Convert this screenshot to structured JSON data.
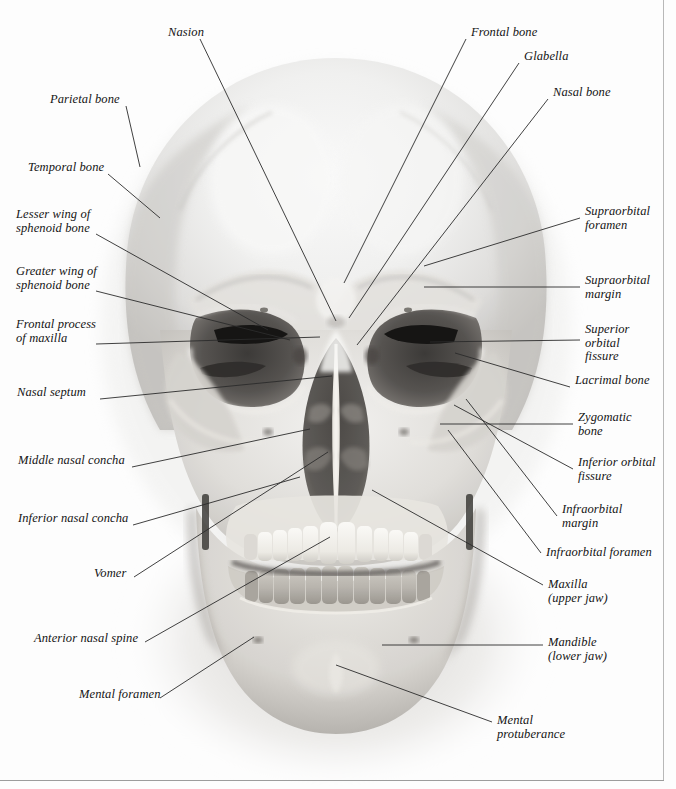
{
  "figure": {
    "kind": "anatomical-illustration",
    "style": "black-and-white photograph with leader-line labels",
    "background_color": "#ffffff",
    "border_color": "#b8b8b8",
    "label_color": "#141414",
    "leader_color": "#2b2b2b",
    "width": 676,
    "height": 789
  },
  "labels": [
    {
      "id": "nasion",
      "text": "Nasion",
      "side": "left",
      "x": 168,
      "y": 26,
      "anchor_x": 200,
      "anchor_y": 39,
      "target_x": 336,
      "target_y": 321
    },
    {
      "id": "frontal-bone",
      "text": "Frontal bone",
      "side": "right",
      "x": 471,
      "y": 26,
      "anchor_x": 466,
      "anchor_y": 39,
      "target_x": 344,
      "target_y": 283
    },
    {
      "id": "glabella",
      "text": "Glabella",
      "side": "right",
      "x": 524,
      "y": 50,
      "anchor_x": 519,
      "anchor_y": 63,
      "target_x": 349,
      "target_y": 318
    },
    {
      "id": "parietal-bone",
      "text": "Parietal bone",
      "side": "left",
      "x": 50,
      "y": 93,
      "anchor_x": 126,
      "anchor_y": 106,
      "target_x": 140,
      "target_y": 167
    },
    {
      "id": "nasal-bone",
      "text": "Nasal bone",
      "side": "right",
      "x": 553,
      "y": 86,
      "anchor_x": 548,
      "anchor_y": 99,
      "target_x": 357,
      "target_y": 345
    },
    {
      "id": "temporal-bone",
      "text": "Temporal bone",
      "side": "left",
      "x": 28,
      "y": 161,
      "anchor_x": 108,
      "anchor_y": 174,
      "target_x": 160,
      "target_y": 218
    },
    {
      "id": "supraorbital-foramen",
      "text": "Supraorbital\nforamen",
      "side": "right",
      "x": 585,
      "y": 205,
      "anchor_x": 580,
      "anchor_y": 218,
      "target_x": 424,
      "target_y": 266
    },
    {
      "id": "lesser-wing-sphenoid",
      "text": "Lesser wing of\nsphenoid bone",
      "side": "left",
      "x": 16,
      "y": 208,
      "anchor_x": 96,
      "anchor_y": 234,
      "target_x": 268,
      "target_y": 330
    },
    {
      "id": "supraorbital-margin",
      "text": "Supraorbital\nmargin",
      "side": "right",
      "x": 585,
      "y": 274,
      "anchor_x": 580,
      "anchor_y": 287,
      "target_x": 424,
      "target_y": 287
    },
    {
      "id": "greater-wing-sphenoid",
      "text": "Greater wing of\nsphenoid bone",
      "side": "left",
      "x": 16,
      "y": 265,
      "anchor_x": 96,
      "anchor_y": 291,
      "target_x": 290,
      "target_y": 340
    },
    {
      "id": "frontal-process-maxilla",
      "text": "Frontal process\nof maxilla",
      "side": "left",
      "x": 16,
      "y": 318,
      "anchor_x": 96,
      "anchor_y": 344,
      "target_x": 320,
      "target_y": 337
    },
    {
      "id": "superior-orbital-fissure",
      "text": "Superior\norbital\nfissure",
      "side": "right",
      "x": 585,
      "y": 323,
      "anchor_x": 580,
      "anchor_y": 340,
      "target_x": 430,
      "target_y": 342
    },
    {
      "id": "lacrimal-bone",
      "text": "Lacrimal bone",
      "side": "right",
      "x": 575,
      "y": 374,
      "anchor_x": 570,
      "anchor_y": 387,
      "target_x": 455,
      "target_y": 353
    },
    {
      "id": "nasal-septum",
      "text": "Nasal septum",
      "side": "left",
      "x": 17,
      "y": 386,
      "anchor_x": 100,
      "anchor_y": 399,
      "target_x": 332,
      "target_y": 376
    },
    {
      "id": "zygomatic-bone",
      "text": "Zygomatic\nbone",
      "side": "right",
      "x": 578,
      "y": 411,
      "anchor_x": 573,
      "anchor_y": 424,
      "target_x": 440,
      "target_y": 424
    },
    {
      "id": "middle-nasal-concha",
      "text": "Middle nasal concha",
      "side": "left",
      "x": 18,
      "y": 454,
      "anchor_x": 132,
      "anchor_y": 467,
      "target_x": 310,
      "target_y": 429
    },
    {
      "id": "inferior-orbital-fissure",
      "text": "Inferior orbital\nfissure",
      "side": "right",
      "x": 578,
      "y": 456,
      "anchor_x": 573,
      "anchor_y": 469,
      "target_x": 454,
      "target_y": 405
    },
    {
      "id": "infraorbital-margin",
      "text": "Infraorbital\nmargin",
      "side": "right",
      "x": 562,
      "y": 503,
      "anchor_x": 557,
      "anchor_y": 516,
      "target_x": 466,
      "target_y": 399
    },
    {
      "id": "inferior-nasal-concha",
      "text": "Inferior nasal concha",
      "side": "left",
      "x": 18,
      "y": 512,
      "anchor_x": 133,
      "anchor_y": 525,
      "target_x": 300,
      "target_y": 477
    },
    {
      "id": "infraorbital-foramen",
      "text": "Infraorbital foramen",
      "side": "right",
      "x": 546,
      "y": 546,
      "anchor_x": 541,
      "anchor_y": 553,
      "target_x": 448,
      "target_y": 430
    },
    {
      "id": "vomer",
      "text": "Vomer",
      "side": "left",
      "x": 94,
      "y": 567,
      "anchor_x": 134,
      "anchor_y": 577,
      "target_x": 328,
      "target_y": 452
    },
    {
      "id": "maxilla",
      "text": "Maxilla\n(upper jaw)",
      "side": "right",
      "x": 548,
      "y": 578,
      "anchor_x": 543,
      "anchor_y": 585,
      "target_x": 372,
      "target_y": 490
    },
    {
      "id": "mandible",
      "text": "Mandible\n(lower jaw)",
      "side": "right",
      "x": 548,
      "y": 636,
      "anchor_x": 543,
      "anchor_y": 645,
      "target_x": 382,
      "target_y": 645
    },
    {
      "id": "anterior-nasal-spine",
      "text": "Anterior nasal spine",
      "side": "left",
      "x": 34,
      "y": 632,
      "anchor_x": 145,
      "anchor_y": 642,
      "target_x": 330,
      "target_y": 537
    },
    {
      "id": "mental-foramen",
      "text": "Mental foramen",
      "side": "left",
      "x": 79,
      "y": 688,
      "anchor_x": 160,
      "anchor_y": 698,
      "target_x": 254,
      "target_y": 637
    },
    {
      "id": "mental-protuberance",
      "text": "Mental\nprotuberance",
      "side": "right",
      "x": 497,
      "y": 714,
      "anchor_x": 492,
      "anchor_y": 722,
      "target_x": 336,
      "target_y": 665
    }
  ]
}
